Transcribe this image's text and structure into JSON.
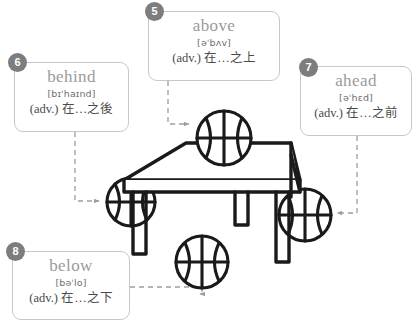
{
  "meta": {
    "illustration_label": "table-with-basketballs-diagram",
    "background_color": "#ffffff",
    "badge_color": "#7d7d7d",
    "card_border_color": "#c8c8c8",
    "word_color": "#9a9a9a",
    "connector_color": "#9e9e9e",
    "ink_color": "#1a1a1a"
  },
  "cards": {
    "above": {
      "number": "5",
      "word": "above",
      "phonetic": "[əˈbʌv]",
      "gloss": "(adv.) 在…之上"
    },
    "behind": {
      "number": "6",
      "word": "behind",
      "phonetic": "[bɪˈhaɪnd]",
      "gloss": "(adv.) 在…之後"
    },
    "ahead": {
      "number": "7",
      "word": "ahead",
      "phonetic": "[əˈhɛd]",
      "gloss": "(adv.) 在…之前"
    },
    "below": {
      "number": "8",
      "word": "below",
      "phonetic": "[bəˈlo]",
      "gloss": "(adv.) 在…之下"
    }
  },
  "illustration": {
    "table_label": "table",
    "balls": [
      {
        "name": "ball-above",
        "cx": 224,
        "cy": 138,
        "r": 27
      },
      {
        "name": "ball-behind",
        "cx": 131,
        "cy": 202,
        "r": 24
      },
      {
        "name": "ball-ahead",
        "cx": 305,
        "cy": 215,
        "r": 26
      },
      {
        "name": "ball-below",
        "cx": 202,
        "cy": 262,
        "r": 26
      }
    ]
  }
}
